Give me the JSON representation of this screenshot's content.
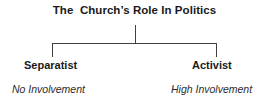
{
  "diagram": {
    "type": "hierarchy-bracket",
    "title": "The  Church’s Role In Politics",
    "line_color": "#404040",
    "text_color": "#1a1a1a",
    "background_color": "#ffffff",
    "branches": [
      {
        "id": "separatist",
        "label": "Separatist",
        "sub_label": "No Involvement",
        "side": "left"
      },
      {
        "id": "activist",
        "label": "Activist",
        "sub_label": "High Involvement",
        "side": "right"
      }
    ],
    "connector": {
      "stem_x": 135,
      "stem_top_y": 25,
      "stem_bottom_y": 43,
      "bar_y": 43,
      "bar_left_x": 52,
      "bar_right_x": 217,
      "drop_bottom_y": 56,
      "stroke_width": 1
    }
  }
}
